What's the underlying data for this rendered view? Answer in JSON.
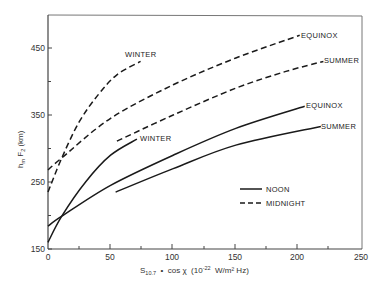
{
  "chart_data": {
    "type": "line",
    "title": "",
    "xlabel": "S10.7 · cos χ (10^-22 W/m² Hz)",
    "ylabel": "hm F2 (km)",
    "xlim": [
      0,
      250
    ],
    "ylim": [
      150,
      500
    ],
    "xticks": [
      0,
      50,
      100,
      150,
      200,
      250
    ],
    "yticks": [
      150,
      250,
      350,
      450
    ],
    "grid": false,
    "legend": [
      {
        "label": "NOON",
        "style": "solid"
      },
      {
        "label": "MIDNIGHT",
        "style": "dashed"
      }
    ],
    "legend_position": "lower right",
    "series": [
      {
        "name": "Midnight Winter",
        "time": "MIDNIGHT",
        "season": "WINTER",
        "style": "dashed",
        "points": [
          [
            0,
            235
          ],
          [
            11,
            286
          ],
          [
            25,
            340
          ],
          [
            40,
            380
          ],
          [
            55,
            410
          ],
          [
            74,
            430
          ]
        ]
      },
      {
        "name": "Midnight Equinox",
        "time": "MIDNIGHT",
        "season": "EQUINOX",
        "style": "dashed",
        "points": [
          [
            0,
            268
          ],
          [
            11,
            286
          ],
          [
            50,
            345
          ],
          [
            100,
            395
          ],
          [
            150,
            435
          ],
          [
            201,
            469
          ]
        ]
      },
      {
        "name": "Midnight Summer",
        "time": "MIDNIGHT",
        "season": "SUMMER",
        "style": "dashed",
        "points": [
          [
            55,
            311
          ],
          [
            100,
            350
          ],
          [
            150,
            390
          ],
          [
            190,
            415
          ],
          [
            220,
            430
          ]
        ]
      },
      {
        "name": "Noon Winter",
        "time": "NOON",
        "season": "WINTER",
        "style": "solid",
        "points": [
          [
            0,
            160
          ],
          [
            11,
            199
          ],
          [
            30,
            250
          ],
          [
            50,
            290
          ],
          [
            71,
            314
          ]
        ]
      },
      {
        "name": "Noon Equinox",
        "time": "NOON",
        "season": "EQUINOX",
        "style": "solid",
        "points": [
          [
            0,
            184
          ],
          [
            11,
            199
          ],
          [
            50,
            245
          ],
          [
            100,
            290
          ],
          [
            150,
            330
          ],
          [
            205,
            363
          ]
        ]
      },
      {
        "name": "Noon Summer",
        "time": "NOON",
        "season": "SUMMER",
        "style": "solid",
        "points": [
          [
            54,
            235
          ],
          [
            100,
            270
          ],
          [
            150,
            305
          ],
          [
            218,
            333
          ]
        ]
      }
    ],
    "annotations": [
      {
        "text": "WINTER",
        "series": "Midnight Winter"
      },
      {
        "text": "EQUINOX",
        "series": "Midnight Equinox"
      },
      {
        "text": "SUMMER",
        "series": "Midnight Summer"
      },
      {
        "text": "WINTER",
        "series": "Noon Winter"
      },
      {
        "text": "EQUINOX",
        "series": "Noon Equinox"
      },
      {
        "text": "SUMMER",
        "series": "Noon Summer"
      }
    ]
  },
  "labels": {
    "ylabel_main": "h",
    "ylabel_sub": "m",
    "ylabel_rest": " F",
    "ylabel_sub2": "2",
    "ylabel_unit": " (km)",
    "xlabel_s": "S",
    "xlabel_sub": "10.7",
    "xlabel_mid": "  •  cos χ  (10",
    "xlabel_sup": "-22",
    "xlabel_end": "  W/m² Hz)",
    "legend_noon": "NOON",
    "legend_midnight": "MIDNIGHT",
    "x0": "0",
    "x50": "50",
    "x100": "100",
    "x150": "150",
    "x200": "200",
    "x250": "250",
    "y150": "150",
    "y250": "250",
    "y350": "350",
    "y450": "450",
    "mw": "WINTER",
    "me": "EQUINOX",
    "ms": "SUMMER",
    "nw": "WINTER",
    "ne": "EQUINOX",
    "ns": "SUMMER"
  },
  "colors": {
    "line": "#1a1a1a",
    "axis": "#444444",
    "background": "#ffffff"
  }
}
